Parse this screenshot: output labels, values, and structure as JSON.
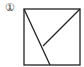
{
  "figure": {
    "label": "①",
    "stroke_color": "#222222",
    "square": {
      "x": 24,
      "y": 9,
      "size": 56
    },
    "segments": [
      {
        "name": "diagonal-from-top-left",
        "x1": 24,
        "y1": 9,
        "x2": 50,
        "y2": 65
      },
      {
        "name": "line-from-top-right",
        "x1": 80,
        "y1": 9,
        "x2": 43,
        "y2": 46
      }
    ]
  }
}
